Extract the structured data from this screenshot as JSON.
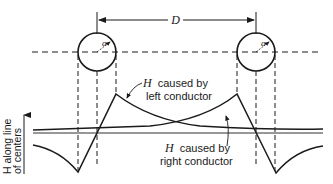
{
  "figure": {
    "distance_label": "D",
    "radius_label": "a",
    "y_axis_label_line1": "H along line",
    "y_axis_label_line2": "of centers",
    "left_curve_label": {
      "symbol": "H",
      "line1": "caused by",
      "line2": "left conductor"
    },
    "right_curve_label": {
      "symbol": "H",
      "line1": "caused by",
      "line2": "right conductor"
    },
    "colors": {
      "ink": "#1a1a1a",
      "background": "#ffffff"
    }
  },
  "geometry": {
    "left_conductor": {
      "cx": 97,
      "cy": 52,
      "r": 19
    },
    "right_conductor": {
      "cx": 256,
      "cy": 52,
      "r": 19
    },
    "center_line_y": 52,
    "baseline_y": 133,
    "left_peak": {
      "x": 116,
      "y": 94
    },
    "left_valley": {
      "x": 78,
      "y": 172
    },
    "right_peak": {
      "x": 237,
      "y": 94
    },
    "right_valley": {
      "x": 276,
      "y": 173
    }
  }
}
